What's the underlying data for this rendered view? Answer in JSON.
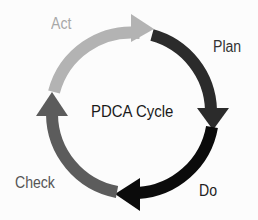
{
  "diagram": {
    "title": "PDCA Cycle",
    "stages": [
      {
        "label": "Plan",
        "color": "#2b2b2b",
        "label_color": "#333333"
      },
      {
        "label": "Do",
        "color": "#0b0b0b",
        "label_color": "#222222"
      },
      {
        "label": "Check",
        "color": "#5c5c5c",
        "label_color": "#555555"
      },
      {
        "label": "Act",
        "color": "#b3b3b3",
        "label_color": "#a8a8a8"
      }
    ]
  }
}
